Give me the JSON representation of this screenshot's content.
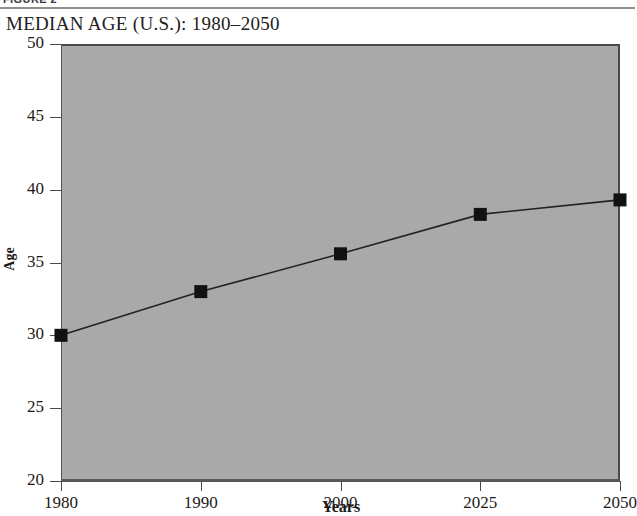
{
  "figure": {
    "label": "FIGURE 2"
  },
  "title": "MEDIAN AGE (U.S.): 1980–2050",
  "colors": {
    "plot_background": "#a9a9a9",
    "page_background": "#ffffff",
    "axis": "#4a4a4a",
    "marker": "#111111",
    "line": "#222222",
    "text": "#1d1a18",
    "rule": "#8e8e8e"
  },
  "chart_data": {
    "type": "line",
    "title": "MEDIAN AGE (U.S.): 1980–2050",
    "xlabel": "Years",
    "ylabel": "Age",
    "categories": [
      "1980",
      "1990",
      "2000",
      "2025",
      "2050"
    ],
    "values": [
      30.0,
      33.0,
      35.6,
      38.3,
      39.3
    ],
    "series": [
      {
        "name": "Median Age",
        "values": [
          30.0,
          33.0,
          35.6,
          38.3,
          39.3
        ]
      }
    ],
    "ylim": [
      20,
      50
    ],
    "y_ticks": [
      20,
      25,
      30,
      35,
      40,
      45,
      50
    ],
    "y_tick_labels": [
      "20",
      "25",
      "30",
      "35",
      "40",
      "45",
      "50"
    ],
    "x_tick_labels": [
      "1980",
      "1990",
      "2000",
      "2025",
      "2050"
    ],
    "grid": false,
    "legend": false,
    "legend_position": "none",
    "marker": "square",
    "marker_color": "#111111",
    "line_color": "#222222"
  }
}
